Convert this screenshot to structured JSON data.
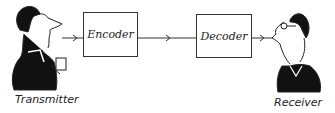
{
  "diagram": {
    "nodes": [
      {
        "id": "transmitter",
        "label": "Transmitter",
        "type": "person"
      },
      {
        "id": "encoder",
        "label": "Encoder",
        "type": "box"
      },
      {
        "id": "decoder",
        "label": "Decoder",
        "type": "box"
      },
      {
        "id": "receiver",
        "label": "Receiver",
        "type": "person"
      }
    ],
    "edges": [
      {
        "from": "transmitter",
        "to": "encoder"
      },
      {
        "from": "encoder",
        "to": "decoder"
      },
      {
        "from": "decoder",
        "to": "receiver"
      }
    ]
  }
}
